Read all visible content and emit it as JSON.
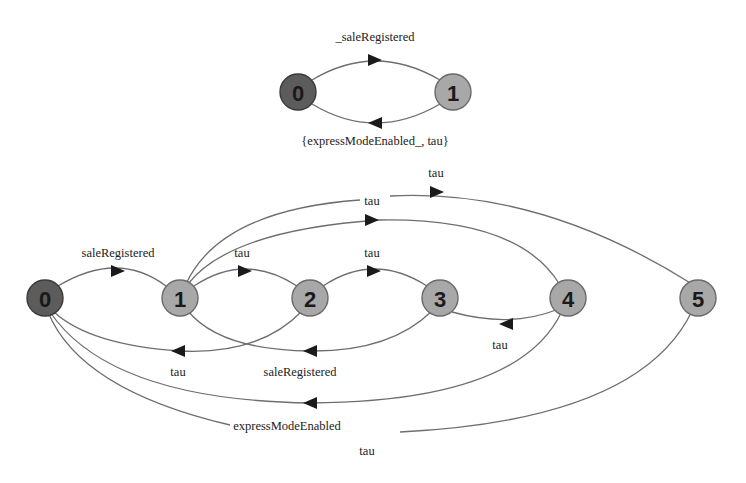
{
  "diagram_top": {
    "nodes": [
      {
        "id": "0",
        "label": "0",
        "x": 298,
        "y": 92,
        "initial": true
      },
      {
        "id": "1",
        "label": "1",
        "x": 453,
        "y": 92,
        "initial": false
      }
    ],
    "edges": [
      {
        "from": "0",
        "to": "1",
        "label": "_saleRegistered",
        "path": "M312,80 Q375,42 440,80",
        "arrow": {
          "x": 375,
          "y": 60,
          "dir": "right"
        },
        "label_x": 375,
        "label_y": 41
      },
      {
        "from": "1",
        "to": "0",
        "label": "{expressModeEnabled_, tau}",
        "path": "M440,104 Q375,142 312,104",
        "arrow": {
          "x": 375,
          "y": 123,
          "dir": "left"
        },
        "label_x": 375,
        "label_y": 145
      }
    ]
  },
  "diagram_bottom": {
    "nodes": [
      {
        "id": "0",
        "label": "0",
        "x": 45,
        "y": 298,
        "initial": true
      },
      {
        "id": "1",
        "label": "1",
        "x": 180,
        "y": 298,
        "initial": false
      },
      {
        "id": "2",
        "label": "2",
        "x": 310,
        "y": 298,
        "initial": false
      },
      {
        "id": "3",
        "label": "3",
        "x": 440,
        "y": 298,
        "initial": false
      },
      {
        "id": "4",
        "label": "4",
        "x": 568,
        "y": 298,
        "initial": false
      },
      {
        "id": "5",
        "label": "5",
        "x": 698,
        "y": 298,
        "initial": false
      }
    ],
    "edges": [
      {
        "from": "0",
        "to": "1",
        "label": "saleRegistered",
        "path": "M58,286 Q118,250 166,286",
        "arrow": {
          "x": 118,
          "y": 271,
          "dir": "right"
        },
        "label_x": 118,
        "label_y": 257
      },
      {
        "from": "1",
        "to": "2",
        "label": "tau",
        "path": "M194,286 Q245,252 297,286",
        "arrow": {
          "x": 245,
          "y": 271,
          "dir": "right"
        },
        "label_x": 242,
        "label_y": 257
      },
      {
        "from": "2",
        "to": "3",
        "label": "tau",
        "path": "M323,286 Q374,252 427,286",
        "arrow": {
          "x": 374,
          "y": 271,
          "dir": "right"
        },
        "label_x": 372,
        "label_y": 257
      },
      {
        "from": "1",
        "to": "4",
        "label": "tau",
        "path": "M188,284 Q230,230 380,220 Q520,218 560,285",
        "arrow": {
          "x": 372,
          "y": 220,
          "dir": "right"
        },
        "label_x": 372,
        "label_y": 205
      },
      {
        "from": "1",
        "to": "5",
        "label": "tau",
        "path": "M186,284 Q220,210 360,200 M390,196 Q540,188 692,284",
        "arrow": {
          "x": 437,
          "y": 192,
          "dir": "right"
        },
        "label_x": 436,
        "label_y": 177
      },
      {
        "from": "4",
        "to": "3",
        "label": "tau",
        "path": "M556,310 Q510,328 452,312",
        "arrow": {
          "x": 506,
          "y": 324,
          "dir": "left"
        },
        "label_x": 500,
        "label_y": 349
      },
      {
        "from": "2",
        "to": "0",
        "label": "tau",
        "path": "M302,311 Q260,355 180,351 Q90,345 54,312",
        "arrow": {
          "x": 178,
          "y": 351,
          "dir": "left"
        },
        "label_x": 178,
        "label_y": 376
      },
      {
        "from": "3",
        "to": "1",
        "label": "saleRegistered",
        "path": "M432,311 Q390,352 310,351 Q220,350 188,311",
        "arrow": {
          "x": 310,
          "y": 351,
          "dir": "left"
        },
        "label_x": 300,
        "label_y": 376
      },
      {
        "from": "4",
        "to": "0",
        "label": "expressModeEnabled",
        "path": "M562,311 Q520,402 310,403 Q110,400 50,312",
        "arrow": {
          "x": 310,
          "y": 403,
          "dir": "left"
        },
        "label_x": 287,
        "label_y": 430
      },
      {
        "from": "5",
        "to": "0",
        "label": "tau",
        "path": "M692,311 Q640,420 400,432 M230,425 Q80,390 48,312",
        "arrow": {
          "x": 290,
          "y": 424,
          "dir": "none"
        },
        "label_x": 367,
        "label_y": 455
      }
    ]
  }
}
